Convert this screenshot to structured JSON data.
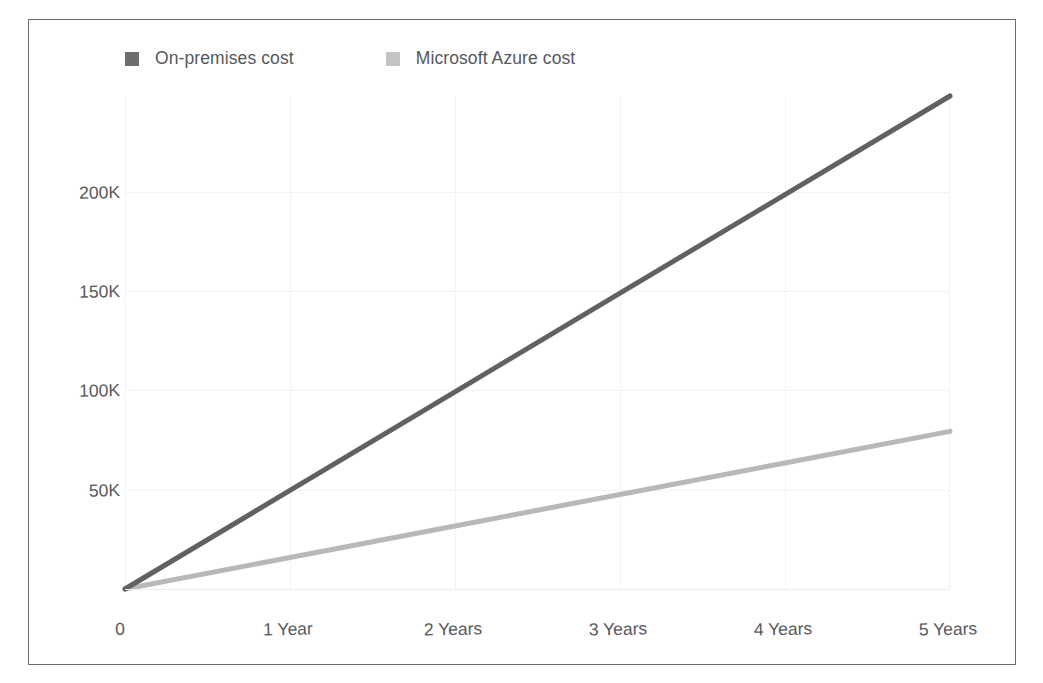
{
  "chart_data": {
    "type": "line",
    "title": "",
    "subtitle": "",
    "xlabel": "",
    "ylabel": "",
    "grid": true,
    "legend_position": "top-left",
    "x": [
      0,
      1,
      2,
      3,
      4,
      5
    ],
    "x_tick_labels": [
      "0",
      "1 Year",
      "2 Years",
      "3 Years",
      "4 Years",
      "5 Years"
    ],
    "y_tick_labels": [
      "50K",
      "100K",
      "150K",
      "200K"
    ],
    "y_tick_values": [
      50000,
      100000,
      150000,
      200000
    ],
    "ylim": [
      0,
      244000
    ],
    "xlim": [
      0,
      5
    ],
    "series": [
      {
        "name": "On-premises cost",
        "color": "#5f6163",
        "values": [
          0,
          48800,
          97600,
          146400,
          195200,
          244000
        ]
      },
      {
        "name": "Microsoft Azure cost",
        "color": "#b6b8ba",
        "values": [
          0,
          15600,
          31200,
          46800,
          62400,
          78000
        ]
      }
    ]
  },
  "legend": {
    "entries": [
      {
        "label": "On-premises cost",
        "color": "#6b6d6f"
      },
      {
        "label": "Microsoft Azure cost",
        "color": "#c2c4c6"
      }
    ]
  },
  "axes": {
    "y_ticks": [
      {
        "label": "200K",
        "value": 200000
      },
      {
        "label": "150K",
        "value": 150000
      },
      {
        "label": "100K",
        "value": 100000
      },
      {
        "label": "50K",
        "value": 50000
      }
    ],
    "x_ticks": [
      {
        "label": "0",
        "value": 0
      },
      {
        "label": "1 Year",
        "value": 1
      },
      {
        "label": "2 Years",
        "value": 2
      },
      {
        "label": "3 Years",
        "value": 3
      },
      {
        "label": "4 Years",
        "value": 4
      },
      {
        "label": "5 Years",
        "value": 5
      }
    ]
  },
  "colors": {
    "frame": "#6e6e6e",
    "grid": "#f3f3f4",
    "baseline": "#ededee",
    "tick_text": "#58595b",
    "legend_text": "#55595c",
    "background": "#ffffff"
  }
}
